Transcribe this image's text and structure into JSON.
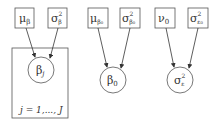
{
  "diagram": {
    "type": "graphical-model",
    "colors": {
      "stroke": "#555555",
      "text": "#333333",
      "background": "#ffffff"
    },
    "groups": [
      {
        "id": "beta_j",
        "parents": [
          {
            "id": "mu_beta",
            "base": "μ",
            "sub": "β",
            "sup": ""
          },
          {
            "id": "sigma2_beta",
            "base": "σ",
            "sub": "β",
            "sup": "2"
          }
        ],
        "child": {
          "id": "beta_j",
          "base": "β",
          "sub": "j",
          "sup": ""
        },
        "plate": {
          "label": "j = 1,..., J"
        }
      },
      {
        "id": "beta_0",
        "parents": [
          {
            "id": "mu_beta0",
            "base": "μ",
            "sub": "β₀",
            "sup": ""
          },
          {
            "id": "sigma2_beta0",
            "base": "σ",
            "sub": "β₀",
            "sup": "2"
          }
        ],
        "child": {
          "id": "beta_0",
          "base": "β",
          "sub": "0",
          "sup": ""
        }
      },
      {
        "id": "sigma2_eps",
        "parents": [
          {
            "id": "nu_0",
            "base": "ν",
            "sub": "0",
            "sup": ""
          },
          {
            "id": "sigma2_eps0",
            "base": "σ",
            "sub": "ε₀",
            "sup": "2"
          }
        ],
        "child": {
          "id": "sigma2_eps",
          "base": "σ",
          "sub": "ε",
          "sup": "2"
        }
      }
    ]
  }
}
